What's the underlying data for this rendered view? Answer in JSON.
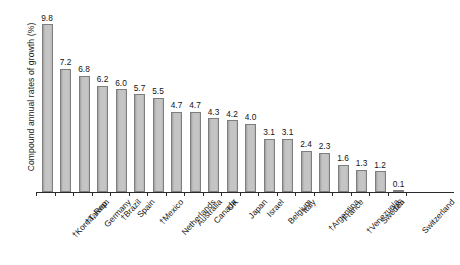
{
  "chart_data": {
    "type": "bar",
    "title": "",
    "xlabel": "",
    "ylabel": "Compound annual rates of growth (%)",
    "ylim": [
      0,
      10.4
    ],
    "grid": false,
    "legend": "none",
    "orientation": "vertical",
    "sorted": "descending",
    "note_symbol": "†",
    "categories": [
      "†Korea, Rep.",
      "†Taiwan",
      "Germany",
      "†Brazil",
      "Spain",
      "†Mexico",
      "Netherlands",
      "Australia",
      "Canada",
      "UK",
      "Japan",
      "Israel",
      "Belgium",
      "Italy",
      "†Argentina",
      "France",
      "†Venezuela",
      "Sweden",
      "US",
      "Switzerland"
    ],
    "values": [
      9.8,
      7.2,
      6.8,
      6.2,
      6.0,
      5.7,
      5.5,
      4.7,
      4.7,
      4.3,
      4.2,
      4.0,
      3.1,
      3.1,
      2.4,
      2.3,
      1.6,
      1.3,
      1.2,
      0.1
    ],
    "value_labels": [
      "9.8",
      "7.2",
      "6.8",
      "6.2",
      "6.0",
      "5.7",
      "5.5",
      "4.7",
      "4.7",
      "4.3",
      "4.2",
      "4.0",
      "3.1",
      "3.1",
      "2.4",
      "2.3",
      "1.6",
      "1.3",
      "1.2",
      "0.1"
    ],
    "bar_fill_color": "#b9b9b9",
    "bar_edge_color": "#7e7e7e",
    "axis_color": "#2b2b2b",
    "background_color": "#ffffff"
  }
}
